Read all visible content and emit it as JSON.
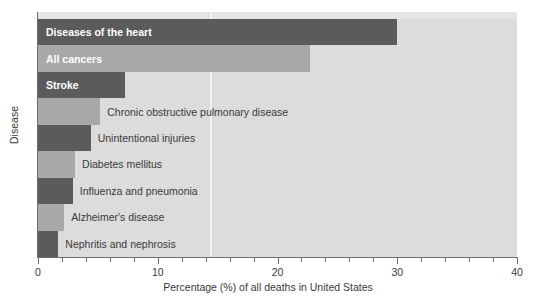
{
  "chart_data": {
    "type": "bar",
    "orientation": "horizontal",
    "title": "",
    "xlabel": "Percentage (%) of all deaths in United States",
    "ylabel": "Disease",
    "xlim": [
      0,
      40
    ],
    "xticks": [
      0,
      10,
      20,
      30,
      40
    ],
    "xtick_labels": [
      "0",
      "10",
      "20",
      "30",
      "40"
    ],
    "minor_tick_step": 2,
    "grid": "single light vertical gridline at 14.4",
    "gridlines": [
      14.4
    ],
    "legend": "none",
    "categories": [
      "Diseases of the heart",
      "All cancers",
      "Stroke",
      "Chronic obstructive pulmonary disease",
      "Unintentional injuries",
      "Diabetes mellitus",
      "Influenza and pneumonia",
      "Alzheimer's disease",
      "Nephritis and nephrosis"
    ],
    "values": [
      30.0,
      22.7,
      7.3,
      5.2,
      4.4,
      3.1,
      2.9,
      2.2,
      1.7
    ],
    "bar_colors": [
      "#5b5b5b",
      "#a8a8a8",
      "#5b5b5b",
      "#a8a8a8",
      "#5b5b5b",
      "#a8a8a8",
      "#5b5b5b",
      "#a8a8a8",
      "#5b5b5b"
    ],
    "label_placement": [
      "inside",
      "inside",
      "inside",
      "outside",
      "outside",
      "outside",
      "outside",
      "outside",
      "outside"
    ],
    "plot_background": "#dcdcdc",
    "axis_color": "#6e6e6e"
  }
}
